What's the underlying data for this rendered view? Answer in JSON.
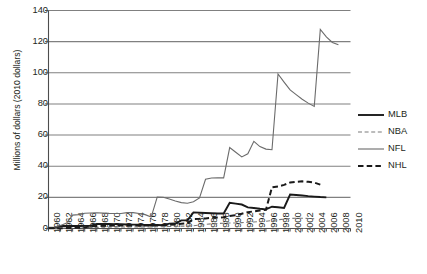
{
  "chart_data": {
    "type": "line",
    "title": "",
    "xlabel": "",
    "ylabel": "Millions of dollars (2010 dollars)",
    "ylim": [
      0,
      140
    ],
    "xlim": [
      1960,
      2010
    ],
    "ytick_labels": [
      "0",
      "20",
      "40",
      "60",
      "80",
      "100",
      "120",
      "140"
    ],
    "ytick_values": [
      0,
      20,
      40,
      60,
      80,
      100,
      120,
      140
    ],
    "grid": true,
    "grid_axis": "y",
    "legend_position": "right",
    "x": [
      1960,
      1961,
      1962,
      1963,
      1964,
      1965,
      1966,
      1967,
      1968,
      1969,
      1970,
      1971,
      1972,
      1973,
      1974,
      1975,
      1976,
      1977,
      1978,
      1979,
      1980,
      1981,
      1982,
      1983,
      1984,
      1985,
      1986,
      1987,
      1988,
      1989,
      1990,
      1991,
      1992,
      1993,
      1994,
      1995,
      1996,
      1997,
      1998,
      1999,
      2000,
      2001,
      2002,
      2003,
      2004,
      2005,
      2006,
      2007,
      2008,
      2009,
      2010
    ],
    "xtick_labels": [
      "1960",
      "1962",
      "1964",
      "1966",
      "1968",
      "1970",
      "1972",
      "1974",
      "1976",
      "1978",
      "1980",
      "1982",
      "1984",
      "1986",
      "1988",
      "1990",
      "1992",
      "1994",
      "1996",
      "1998",
      "2000",
      "2002",
      "2004",
      "2006",
      "2008",
      "2010"
    ],
    "series": [
      {
        "name": "MLB",
        "color": "#1a1a1a",
        "style": "solid",
        "width": 1.9,
        "values": [
          0.4,
          0.5,
          1.6,
          1.6,
          1.6,
          1.6,
          1.7,
          1.8,
          2.9,
          2.9,
          2.9,
          2.8,
          2.7,
          2.6,
          2.5,
          2.4,
          2.3,
          2.2,
          2.2,
          2.1,
          3.1,
          3.2,
          5.2,
          5.2,
          10.3,
          10.2,
          10.0,
          9.8,
          9.6,
          9.6,
          16.5,
          16.0,
          15.4,
          13.6,
          13.2,
          12.7,
          12.3,
          14.0,
          13.6,
          13.2,
          21.8,
          21.5,
          21.2,
          20.8,
          20.5,
          20.2,
          20.0,
          null,
          null,
          null,
          null
        ]
      },
      {
        "name": "NBA",
        "color": "#7a7a7a",
        "style": "dashed-fine",
        "width": 1.1,
        "values": [
          0.2,
          0.2,
          0.3,
          0.3,
          0.4,
          0.4,
          0.5,
          0.6,
          0.7,
          0.8,
          0.9,
          1.0,
          1.0,
          1.0,
          1.0,
          1.0,
          1.0,
          1.0,
          1.1,
          1.2,
          1.3,
          1.4,
          1.5,
          1.6,
          1.8,
          2.2,
          2.6,
          3.0,
          3.2,
          3.4,
          3.5,
          3.6,
          3.8,
          4.0,
          4.2,
          4.4,
          4.6,
          5.2,
          5.6,
          6.0,
          6.4,
          6.6,
          6.6,
          6.4,
          6.3,
          null,
          null,
          null,
          null,
          null,
          null
        ]
      },
      {
        "name": "NFL",
        "color": "#6b6b6b",
        "style": "solid",
        "width": 1.1,
        "values": [
          0.8,
          1.0,
          1.9,
          3.5,
          8.6,
          8.9,
          9.8,
          10.0,
          10.1,
          9.9,
          9.7,
          9.6,
          9.6,
          10.2,
          10.2,
          9.6,
          8.9,
          7.3,
          20.2,
          20.1,
          18.9,
          17.7,
          16.6,
          16.2,
          17.2,
          19.6,
          31.6,
          32.4,
          32.6,
          32.5,
          52.0,
          49.0,
          46.0,
          48.0,
          56.0,
          52.6,
          51.0,
          50.6,
          99.2,
          94.0,
          89.0,
          86.0,
          83.0,
          80.5,
          78.4,
          127.8,
          123.0,
          119.5,
          118.0,
          null,
          null
        ]
      },
      {
        "name": "NHL",
        "color": "#1a1a1a",
        "style": "dashed-bold",
        "width": 2.0,
        "values": [
          0.1,
          0.1,
          0.2,
          0.3,
          0.4,
          0.5,
          0.6,
          1.5,
          1.6,
          1.7,
          1.8,
          1.9,
          2.0,
          2.0,
          2.0,
          2.0,
          2.0,
          2.0,
          2.1,
          2.2,
          2.4,
          2.6,
          3.0,
          3.4,
          6.0,
          6.2,
          6.5,
          6.8,
          7.0,
          7.2,
          8.0,
          8.5,
          9.5,
          10.5,
          11.0,
          11.5,
          12.0,
          26.5,
          27.0,
          28.0,
          29.5,
          30.0,
          30.3,
          30.0,
          29.5,
          28.2,
          null,
          null,
          null,
          null,
          null
        ]
      }
    ]
  },
  "legend": {
    "entries": [
      {
        "label": "MLB"
      },
      {
        "label": "NBA"
      },
      {
        "label": "NFL"
      },
      {
        "label": "NHL"
      }
    ]
  }
}
